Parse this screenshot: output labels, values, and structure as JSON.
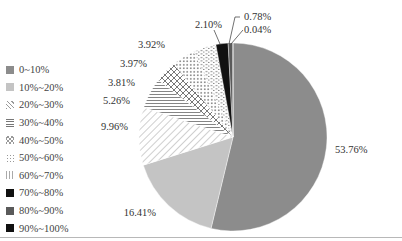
{
  "chart_data": {
    "type": "pie",
    "title": "",
    "start_angle": "12 o'clock, clockwise",
    "categories": [
      "0~10%",
      "10%~20%",
      "20%~30%",
      "30%~40%",
      "40%~50%",
      "50%~60%",
      "60%~70%",
      "70%~80%",
      "80%~90%",
      "90%~100%"
    ],
    "values": [
      53.76,
      16.41,
      9.96,
      5.26,
      3.81,
      3.97,
      3.92,
      2.1,
      0.78,
      0.04
    ],
    "value_labels": [
      "53.76%",
      "16.41%",
      "9.96%",
      "5.26%",
      "3.81%",
      "3.97%",
      "3.92%",
      "2.10%",
      "0.78%",
      "0.04%"
    ],
    "fills": [
      "#8c8c8c",
      "#c4c4c4",
      "diagonal-hatch",
      "horizontal-lines",
      "diamond-crosshatch",
      "dots",
      "dashes",
      "#111111",
      "#5a5a5a",
      "#111111"
    ],
    "legend_position": "left"
  },
  "legend": {
    "items": [
      {
        "label": "0~10%"
      },
      {
        "label": "10%~20%"
      },
      {
        "label": "20%~30%"
      },
      {
        "label": "30%~40%"
      },
      {
        "label": "40%~50%"
      },
      {
        "label": "50%~60%"
      },
      {
        "label": "60%~70%"
      },
      {
        "label": "70%~80%"
      },
      {
        "label": "80%~90%"
      },
      {
        "label": "90%~100%"
      }
    ]
  }
}
